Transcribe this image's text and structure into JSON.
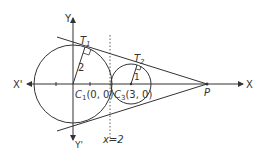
{
  "diagram": {
    "axes": {
      "x_pos": "X",
      "x_neg": "X'",
      "y_pos": "Y",
      "y_neg": "Y'"
    },
    "circles": [
      {
        "name": "C1",
        "label": "C",
        "sub": "1",
        "coords": "(0, 0)",
        "radius_label": "2"
      },
      {
        "name": "C3",
        "label": "C",
        "sub": "3",
        "coords": "(3, 0)",
        "radius_label": "1"
      }
    ],
    "tangent_points": [
      {
        "label": "T",
        "sub": "1"
      },
      {
        "label": "T",
        "sub": "2"
      }
    ],
    "external_point": "P",
    "vertical_line_label": "x=2",
    "colors": {
      "stroke": "#333333",
      "background": "#ffffff"
    }
  }
}
